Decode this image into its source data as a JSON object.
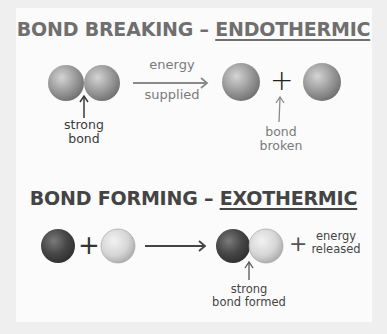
{
  "colors": {
    "background": "#efefef",
    "panel": "#fbfbfb",
    "title_endothermic": "#6f6f6f",
    "title_exothermic": "#444444",
    "atom_mid_gray": "#9a9a9a",
    "atom_dark": "#4a4a4a",
    "atom_light": "#d8d8d8",
    "arrow_light": "#8a8a8a",
    "arrow_dark": "#444444"
  },
  "bond_breaking": {
    "title_prefix": "BOND BREAKING – ",
    "title_emphasis": "ENDOTHERMIC",
    "arrow_label_top": "energy",
    "arrow_label_bottom": "supplied",
    "plus": "+",
    "bond_label_line1": "strong",
    "bond_label_line2": "bond",
    "broken_label_line1": "bond",
    "broken_label_line2": "broken"
  },
  "bond_forming": {
    "title_prefix": "BOND FORMING – ",
    "title_emphasis": "EXOTHERMIC",
    "plus": "+",
    "plus_energy": "+",
    "energy_label_line1": "energy",
    "energy_label_line2": "released",
    "bond_label_line1": "strong",
    "bond_label_line2": "bond formed"
  }
}
